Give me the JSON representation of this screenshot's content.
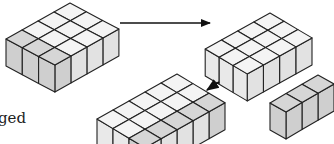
{
  "figure": {
    "colors": {
      "outline": "#222222",
      "top_plain": "#f4f4f4",
      "top_shaded": "#d6d6d6",
      "side_left": "#e9e9e9",
      "side_right": "#e2e2e2",
      "side_shaded": "#cfcfcf",
      "arrow": "#111111"
    },
    "blocks": [
      {
        "name": "block-initial",
        "cells_left": 4,
        "cells_right": 3,
        "shaded": "front-right-row"
      },
      {
        "name": "block-remaining",
        "cells_left": 4,
        "cells_right": 3,
        "shaded": "none"
      },
      {
        "name": "block-rearranged",
        "cells_left": 5,
        "cells_right": 3,
        "shaded": "right-column"
      },
      {
        "name": "block-removed-row",
        "cells_left": 3,
        "cells_right": 1,
        "shaded": "all"
      }
    ],
    "arrows": [
      {
        "name": "arrow-transform",
        "direction": "right"
      },
      {
        "name": "arrow-insert",
        "direction": "down-left"
      }
    ]
  },
  "caption": {
    "lines": [
      "ged",
      "king",
      "d",
      "nodel"
    ]
  }
}
